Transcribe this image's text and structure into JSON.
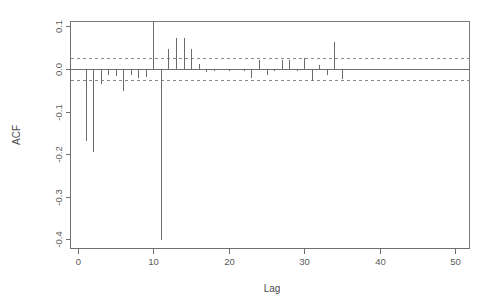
{
  "chart_data": {
    "type": "bar",
    "title": "",
    "subtitle": "",
    "xlabel": "Lag",
    "ylabel": "ACF",
    "xlim": [
      -1,
      52
    ],
    "ylim": [
      -0.42,
      0.13
    ],
    "grid": false,
    "legend": null,
    "x_ticks": [
      0,
      10,
      20,
      30,
      40,
      50
    ],
    "x_tick_labels": [
      "0",
      "10",
      "20",
      "30",
      "40",
      "50"
    ],
    "y_ticks": [
      0.1,
      0.0,
      -0.1,
      -0.2,
      -0.3,
      -0.4
    ],
    "y_tick_labels": [
      "0.1",
      "0.0",
      "-0.1",
      "-0.2",
      "-0.3",
      "-0.4"
    ],
    "confidence_bounds": [
      0.025,
      -0.025
    ],
    "zero_line": 0.0,
    "categories": [
      1,
      2,
      3,
      4,
      5,
      6,
      7,
      8,
      9,
      10,
      11,
      12,
      13,
      14,
      15,
      16,
      17,
      18,
      19,
      20,
      21,
      22,
      23,
      24,
      25,
      26,
      27,
      28,
      29,
      30,
      31,
      32,
      33,
      34,
      35
    ],
    "values": [
      -0.17,
      -0.196,
      -0.035,
      -0.013,
      -0.016,
      -0.051,
      -0.014,
      -0.022,
      -0.019,
      0.11,
      -0.402,
      0.046,
      0.073,
      0.073,
      0.046,
      0.012,
      -0.006,
      -0.004,
      -0.002,
      -0.005,
      -0.003,
      -0.004,
      -0.021,
      0.02,
      -0.013,
      -0.004,
      0.02,
      0.021,
      -0.004,
      0.025,
      -0.029,
      0.01,
      -0.013,
      0.063,
      -0.024
    ]
  },
  "axes": {
    "ylabel": "ACF",
    "xlabel": "Lag"
  }
}
